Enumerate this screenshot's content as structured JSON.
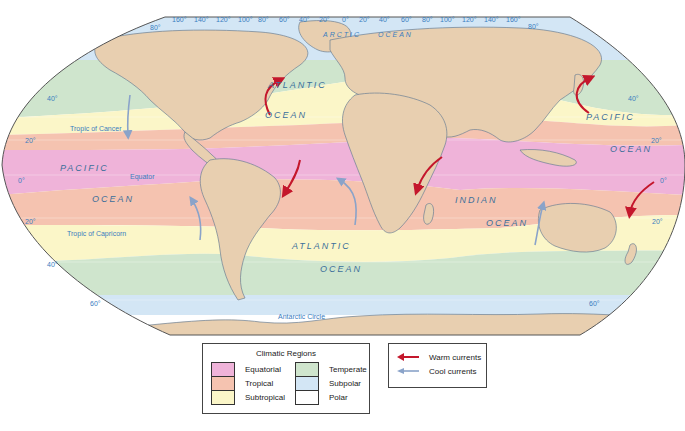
{
  "map": {
    "title": "World Climatic Regions and Ocean Currents",
    "top_longitude_labels": [
      "80°",
      "160°",
      "140°",
      "120°",
      "100°",
      "80°",
      "60°",
      "40°",
      "20°",
      "0°",
      "20°",
      "40°",
      "60°",
      "80°",
      "100°",
      "120°",
      "140°",
      "160°",
      "80°"
    ],
    "latitude_labels": {
      "left": [
        "40°",
        "20°",
        "0°",
        "20°",
        "40°",
        "60°"
      ],
      "right": [
        "40°",
        "20°",
        "0°",
        "20°",
        "60°"
      ]
    },
    "lines": {
      "tropic_cancer": "Tropic of Cancer",
      "equator": "Equator",
      "tropic_capricorn": "Tropic of Capricorn",
      "antarctic_circle": "Antarctic Circle"
    },
    "ocean_labels": {
      "arctic_1": "ARCTIC",
      "arctic_2": "OCEAN",
      "n_atlantic_1": "ATLANTIC",
      "n_atlantic_2": "OCEAN",
      "pacific_w_1": "PACIFIC",
      "pacific_w_2": "OCEAN",
      "pacific_e_1": "PACIFIC",
      "pacific_e_2": "OCEAN",
      "indian_1": "INDIAN",
      "indian_2": "OCEAN",
      "s_atlantic_1": "ATLANTIC",
      "s_atlantic_2": "OCEAN"
    },
    "colors": {
      "equatorial": "#ef b3d9",
      "tropical": "#f5c3b0",
      "subtropical": "#fbf6c8",
      "temperate": "#cfe5cd",
      "subpolar": "#d3e6f5",
      "polar": "#ffffff",
      "land": "#e8cfb0",
      "warm_current": "#c4172c",
      "cool_current": "#8aa3c9"
    }
  },
  "legend": {
    "title": "Climatic Regions",
    "items": [
      {
        "label": "Equatorial",
        "color": "#efb3d9"
      },
      {
        "label": "Tropical",
        "color": "#f5c3b0"
      },
      {
        "label": "Subtropical",
        "color": "#fbf6c8"
      },
      {
        "label": "Temperate",
        "color": "#cfe5cd"
      },
      {
        "label": "Subpolar",
        "color": "#d3e6f5"
      },
      {
        "label": "Polar",
        "color": "#ffffff"
      }
    ]
  },
  "currents_legend": {
    "warm": "Warm currents",
    "cool": "Cool currents"
  }
}
